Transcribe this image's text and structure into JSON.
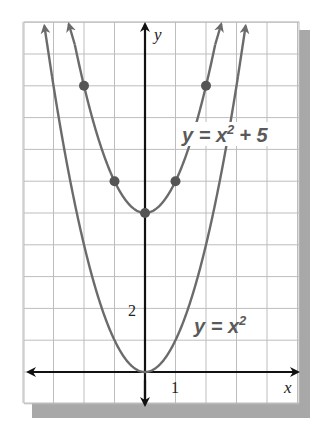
{
  "figure": {
    "type": "coordinate-plane-graph",
    "x_axis_label": "x",
    "y_axis_label": "y",
    "x_tick_label": "1",
    "y_tick_label": "2",
    "grid": {
      "x_min": -4,
      "x_max": 5,
      "y_min": -1,
      "y_max": 11,
      "x_unit": 1,
      "y_unit": 1
    },
    "colors": {
      "curve": "#6b6b6b",
      "axis": "#111111",
      "grid": "#bdbdbd",
      "shadow": "#a8a8a8",
      "point": "#555555"
    }
  },
  "chart_data": {
    "type": "line",
    "title": "",
    "xlabel": "x",
    "ylabel": "y",
    "xlim": [
      -4,
      5
    ],
    "ylim": [
      -1,
      11
    ],
    "grid": true,
    "series": [
      {
        "name": "y = x^2 + 5",
        "label_text": {
          "base": "y = x",
          "exp": "2",
          "tail": "+ 5"
        },
        "function": "x^2+5",
        "points": [
          {
            "x": -2,
            "y": 9
          },
          {
            "x": -1,
            "y": 6
          },
          {
            "x": 0,
            "y": 5
          },
          {
            "x": 1,
            "y": 6
          },
          {
            "x": 2,
            "y": 9
          }
        ]
      },
      {
        "name": "y = x^2",
        "label_text": {
          "base": "y = x",
          "exp": "2"
        },
        "function": "x^2",
        "points": []
      }
    ],
    "annotations": [
      "x",
      "y",
      "1",
      "2"
    ]
  }
}
